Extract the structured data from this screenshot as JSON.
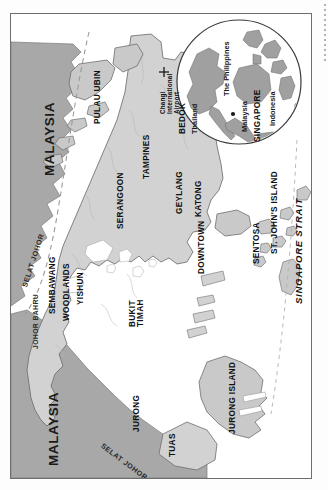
{
  "map": {
    "title": "Singapore",
    "orientation": "rotated-90-ccw",
    "colors": {
      "foreign_land": "#a8a8a8",
      "singapore_land": "#d2d2d2",
      "water": "#ffffff",
      "coast_line": "#6f6f6f",
      "frame": "#6e6e6e",
      "inset_land": "#a0a0a0"
    },
    "countries": [
      {
        "name": "MALAYSIA"
      },
      {
        "name": "MALAYSIA"
      }
    ],
    "cities": [
      {
        "name": "JOHOR BAHRU"
      }
    ],
    "districts": [
      {
        "name": "PULAU UBIN"
      },
      {
        "name": "TAMPINES"
      },
      {
        "name": "BEDOK"
      },
      {
        "name": "SERANGOON"
      },
      {
        "name": "GEYLANG"
      },
      {
        "name": "KATONG"
      },
      {
        "name": "DOWNTOWN"
      },
      {
        "name": "SENTOSA"
      },
      {
        "name": "SEMBAWANG"
      },
      {
        "name": "WOODLANDS"
      },
      {
        "name": "YISHUN"
      },
      {
        "name": "BUKIT"
      },
      {
        "name": "TIMAH"
      },
      {
        "name": "JURONG"
      },
      {
        "name": "TUAS"
      },
      {
        "name": "JURONG ISLAND"
      },
      {
        "name": "ST. JOHN'S ISLAND"
      }
    ],
    "waters": [
      {
        "name": "SELAT JOHOR"
      },
      {
        "name": "SELAT JOHOR"
      },
      {
        "name": "SINGAPORE STRAIT"
      }
    ],
    "poi": {
      "airport_marker": "+",
      "airport_line1": "Changi",
      "airport_line2": "International",
      "airport_line3": "Airport"
    }
  },
  "inset": {
    "labels": [
      {
        "name": "Thailand"
      },
      {
        "name": "The Philippines"
      },
      {
        "name": "Malaysia"
      },
      {
        "name": "Indonesia"
      },
      {
        "name": "SINGAPORE"
      }
    ]
  },
  "labels": {
    "malaysia_north": "MALAYSIA",
    "malaysia_west": "MALAYSIA",
    "johor_bahru": "JOHOR BAHRU",
    "pulau_ubin": "PULAU UBIN",
    "tampines": "TAMPINES",
    "bedok": "BEDOK",
    "serangoon": "SERANGOON",
    "geylang": "GEYLANG",
    "katong": "KATONG",
    "downtown": "DOWNTOWN",
    "sentosa": "SENTOSA",
    "sembawang": "SEMBAWANG",
    "woodlands": "WOODLANDS",
    "yishun": "YISHUN",
    "bukit": "BUKIT",
    "timah": "TIMAH",
    "jurong": "JURONG",
    "tuas": "TUAS",
    "jurong_island": "JURONG ISLAND",
    "st_johns_island": "ST. JOHN'S ISLAND",
    "selat_johor_n": "SELAT JOHOR",
    "selat_johor_s": "SELAT JOHOR",
    "singapore_strait": "SINGAPORE STRAIT",
    "airport_marker": "+",
    "airport_l1": "Changi",
    "airport_l2": "International",
    "airport_l3": "Airport",
    "inset_thailand": "Thailand",
    "inset_philippines": "The Philippines",
    "inset_malaysia": "Malaysia",
    "inset_indonesia": "Indonesia",
    "inset_singapore": "SINGAPORE"
  }
}
